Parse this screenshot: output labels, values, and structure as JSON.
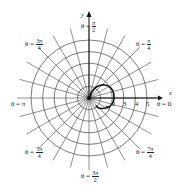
{
  "diagram": {
    "center": {
      "x": 89,
      "y": 98
    },
    "unit_px": 11.6,
    "rings": [
      1,
      2,
      3,
      4,
      5
    ],
    "radial_step_deg": 15,
    "radial_extent": 6.2,
    "colors": {
      "grid": "#444444",
      "curve": "#111111",
      "axis": "#111111",
      "background": "#ffffff"
    }
  },
  "axes": {
    "x_label": "x",
    "y_label": "y"
  },
  "radius_ticks": [
    "2",
    "3",
    "4",
    "5"
  ],
  "angle_labels": [
    {
      "id": "theta-0",
      "prefix": "θ = ",
      "value": "0"
    },
    {
      "id": "theta-pi-over-4",
      "prefix": "θ = ",
      "num": "π",
      "den": "4"
    },
    {
      "id": "theta-pi-over-2",
      "prefix": "θ = ",
      "num": "π",
      "den": "2"
    },
    {
      "id": "theta-3pi-over-4",
      "prefix": "θ = ",
      "num": "3π",
      "den": "4"
    },
    {
      "id": "theta-pi",
      "prefix": "θ = ",
      "value": "π"
    },
    {
      "id": "theta-5pi-over-4",
      "prefix": "θ = ",
      "num": "5π",
      "den": "4"
    },
    {
      "id": "theta-3pi-over-2",
      "prefix": "θ = ",
      "num": "3π",
      "den": "2"
    },
    {
      "id": "theta-7pi-over-4",
      "prefix": "θ = ",
      "num": "7π",
      "den": "4"
    }
  ]
}
